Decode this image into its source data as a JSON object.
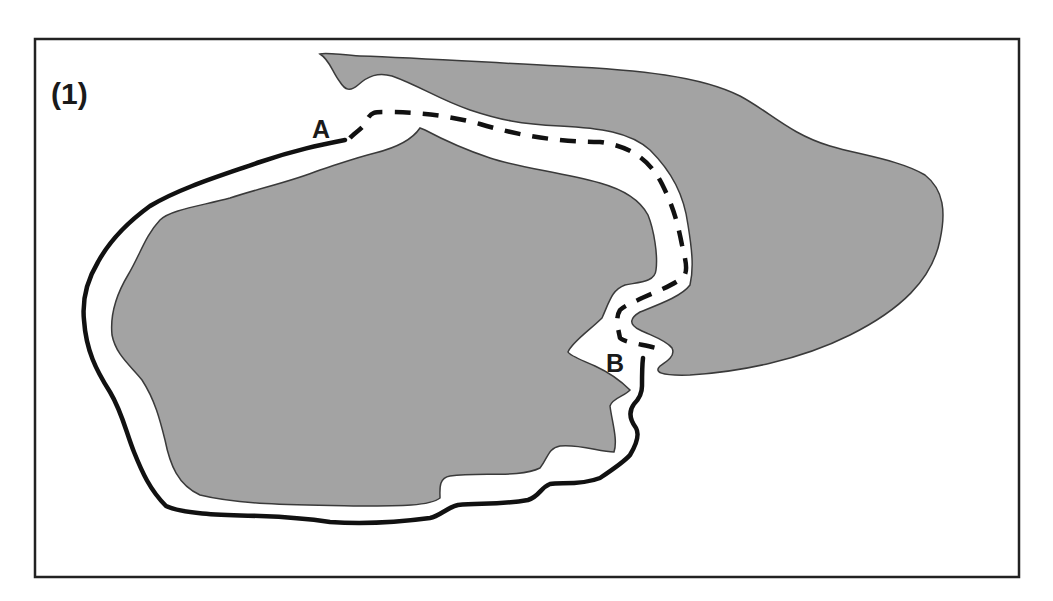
{
  "figure": {
    "panel_label": "(1)",
    "point_labels": {
      "a": "A",
      "b": "B"
    },
    "colors": {
      "background": "#ffffff",
      "frame": "#222222",
      "region_fill": "#a3a3a3",
      "region_outline": "#3a3a3a",
      "path": "#111111"
    },
    "elements": {
      "left_region": "large irregular gray region (left body)",
      "right_region": "gray region extending right (right body)",
      "solid_path": "solid path from A around the left region's outer boundary to B",
      "dashed_path": "dashed path from A through the gap between the regions to B"
    }
  }
}
